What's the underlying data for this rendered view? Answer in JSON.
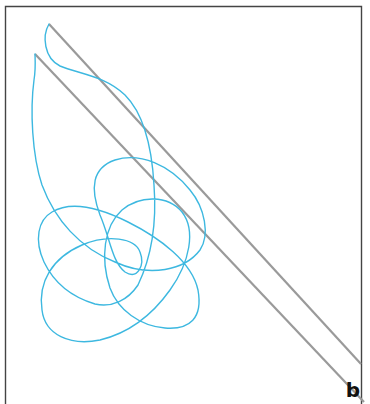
{
  "figure": {
    "panel_label": "b",
    "colors": {
      "frame": "#444444",
      "reference_lines": "#9a9a9a",
      "trajectory": "#3db8e0",
      "background": "#ffffff"
    },
    "elements": {
      "frame": "open-bottom rectangular border",
      "reference_lines": [
        "upper diagonal line",
        "lower diagonal line"
      ],
      "trajectory": "looping blue curve"
    }
  }
}
